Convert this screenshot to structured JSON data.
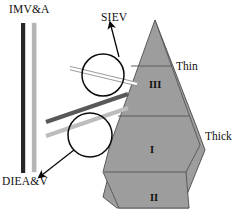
{
  "figure": {
    "labels": {
      "imv_a": "IMV&A",
      "diea_v": "DIEA&V",
      "siev": "SIEV",
      "thin": "Thin",
      "thick": "Thick",
      "segment_iii": "III",
      "segment_i": "I",
      "segment_ii": "II"
    },
    "colors": {
      "flap_fill": "#9d9d9d",
      "flap_stroke": "#4a4a4a",
      "vessel_dark": "#262626",
      "vessel_light": "#b4b4b4",
      "vessel_mid": "#707070",
      "outline": "#0a0a0a",
      "background": "#ffffff",
      "text": "#101010"
    },
    "vertical_vessels": [
      {
        "name": "imv-artery-dark-bar",
        "x": 22,
        "top": 23,
        "bottom": 173,
        "width": 4,
        "color": "#262626"
      },
      {
        "name": "imv-vein-light-bar",
        "x": 33,
        "top": 23,
        "bottom": 172,
        "width": 4,
        "color": "#b4b4b4"
      }
    ],
    "diagonal_vessels": [
      {
        "name": "siev-thin-vessel",
        "color": "#f2f2f2"
      },
      {
        "name": "diea-dark-vessel",
        "color": "#585858"
      },
      {
        "name": "diev-light-vessel",
        "color": "#bdbdbd"
      }
    ],
    "magnifier_circles": [
      {
        "name": "upper-magnifier-circle",
        "cx": 103,
        "cy": 75,
        "r": 21
      },
      {
        "name": "lower-magnifier-circle",
        "cx": 90,
        "cy": 135,
        "r": 22
      }
    ],
    "flap_segments": [
      {
        "name": "segment-iii",
        "label": "III",
        "thickness": "Thin"
      },
      {
        "name": "segment-i",
        "label": "I",
        "thickness": "Thick"
      },
      {
        "name": "segment-ii",
        "label": "II",
        "thickness": "Thick"
      }
    ]
  }
}
